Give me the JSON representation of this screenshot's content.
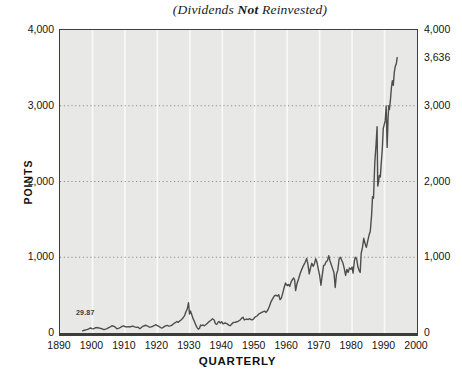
{
  "title": {
    "prefix": "(Dividends ",
    "emphasis": "Not",
    "suffix": " Reinvested)"
  },
  "colors": {
    "plot_bg": "#e8e8e6",
    "grid_vertical": "#f8f8f6",
    "grid_dotted": "#8e8e8e",
    "line": "#4e4e4e",
    "frame": "#3d3d3d",
    "text": "#111111"
  },
  "chart_data": {
    "type": "line",
    "title": "(Dividends Not Reinvested)",
    "xlabel": "QUARTERLY",
    "ylabel": "POINTS",
    "xlim": [
      1890,
      2000
    ],
    "ylim": [
      0,
      4000
    ],
    "grid": {
      "horizontal_dotted_at": [
        1000,
        2000,
        3000
      ],
      "vertical_lines_at": [
        1900,
        1910,
        1920,
        1930,
        1940,
        1950,
        1960,
        1970,
        1980,
        1990
      ]
    },
    "y_ticks_left": [
      {
        "label": "4,000",
        "value": 4000
      },
      {
        "label": "3,000",
        "value": 3000
      },
      {
        "label": "2,000",
        "value": 2000
      },
      {
        "label": "1,000",
        "value": 1000
      },
      {
        "label": "0",
        "value": 0
      }
    ],
    "y_ticks_right": [
      {
        "label": "4,000",
        "value": 4000
      },
      {
        "label": "3,636",
        "value": 3636
      },
      {
        "label": "3,000",
        "value": 3000
      },
      {
        "label": "2,000",
        "value": 2000
      },
      {
        "label": "1,000",
        "value": 1000
      },
      {
        "label": "0",
        "value": 0
      }
    ],
    "x_ticks": [
      {
        "label": "1890",
        "value": 1890
      },
      {
        "label": "1900",
        "value": 1900
      },
      {
        "label": "1910",
        "value": 1910
      },
      {
        "label": "1920",
        "value": 1920
      },
      {
        "label": "1930",
        "value": 1930
      },
      {
        "label": "1940",
        "value": 1940
      },
      {
        "label": "1950",
        "value": 1950
      },
      {
        "label": "1960",
        "value": 1960
      },
      {
        "label": "1970",
        "value": 1970
      },
      {
        "label": "1980",
        "value": 1980
      },
      {
        "label": "1990",
        "value": 1990
      },
      {
        "label": "2000",
        "value": 2000
      }
    ],
    "start_value_label": "29.87",
    "end_value_label": "3,636",
    "series": [
      {
        "name": "Dow Jones Industrial Average (points, quarterly)",
        "points": [
          [
            1897.0,
            30
          ],
          [
            1897.5,
            36
          ],
          [
            1898.0,
            42
          ],
          [
            1898.5,
            47
          ],
          [
            1899.0,
            58
          ],
          [
            1899.4,
            66
          ],
          [
            1899.8,
            58
          ],
          [
            1900.2,
            54
          ],
          [
            1900.6,
            60
          ],
          [
            1901.0,
            70
          ],
          [
            1901.5,
            72
          ],
          [
            1902.0,
            66
          ],
          [
            1902.5,
            62
          ],
          [
            1903.0,
            54
          ],
          [
            1903.5,
            45
          ],
          [
            1904.0,
            50
          ],
          [
            1904.5,
            58
          ],
          [
            1905.0,
            72
          ],
          [
            1905.5,
            80
          ],
          [
            1906.0,
            96
          ],
          [
            1906.5,
            90
          ],
          [
            1907.0,
            78
          ],
          [
            1907.5,
            56
          ],
          [
            1908.0,
            62
          ],
          [
            1908.5,
            72
          ],
          [
            1909.0,
            84
          ],
          [
            1909.5,
            94
          ],
          [
            1910.0,
            86
          ],
          [
            1910.5,
            80
          ],
          [
            1911.0,
            84
          ],
          [
            1911.5,
            80
          ],
          [
            1912.0,
            86
          ],
          [
            1912.5,
            90
          ],
          [
            1913.0,
            80
          ],
          [
            1913.5,
            75
          ],
          [
            1914.0,
            78
          ],
          [
            1914.6,
            56
          ],
          [
            1915.0,
            70
          ],
          [
            1915.5,
            88
          ],
          [
            1916.0,
            96
          ],
          [
            1916.5,
            102
          ],
          [
            1917.0,
            92
          ],
          [
            1917.6,
            76
          ],
          [
            1918.0,
            80
          ],
          [
            1918.5,
            86
          ],
          [
            1919.0,
            96
          ],
          [
            1919.5,
            110
          ],
          [
            1920.0,
            96
          ],
          [
            1920.5,
            86
          ],
          [
            1921.0,
            72
          ],
          [
            1921.5,
            66
          ],
          [
            1922.0,
            80
          ],
          [
            1922.5,
            94
          ],
          [
            1923.0,
            100
          ],
          [
            1923.5,
            90
          ],
          [
            1924.0,
            94
          ],
          [
            1924.5,
            104
          ],
          [
            1925.0,
            122
          ],
          [
            1925.5,
            136
          ],
          [
            1926.0,
            152
          ],
          [
            1926.4,
            140
          ],
          [
            1926.8,
            156
          ],
          [
            1927.2,
            168
          ],
          [
            1927.6,
            185
          ],
          [
            1928.0,
            205
          ],
          [
            1928.4,
            230
          ],
          [
            1928.8,
            280
          ],
          [
            1929.2,
            315
          ],
          [
            1929.6,
            400
          ],
          [
            1929.9,
            250
          ],
          [
            1930.2,
            290
          ],
          [
            1930.6,
            240
          ],
          [
            1931.0,
            190
          ],
          [
            1931.4,
            155
          ],
          [
            1931.8,
            110
          ],
          [
            1932.2,
            75
          ],
          [
            1932.6,
            50
          ],
          [
            1933.0,
            62
          ],
          [
            1933.3,
            105
          ],
          [
            1933.7,
            98
          ],
          [
            1934.0,
            106
          ],
          [
            1934.5,
            95
          ],
          [
            1935.0,
            112
          ],
          [
            1935.5,
            132
          ],
          [
            1936.0,
            152
          ],
          [
            1936.5,
            168
          ],
          [
            1937.0,
            188
          ],
          [
            1937.5,
            172
          ],
          [
            1937.9,
            122
          ],
          [
            1938.3,
            112
          ],
          [
            1938.7,
            142
          ],
          [
            1939.0,
            152
          ],
          [
            1939.4,
            132
          ],
          [
            1939.8,
            150
          ],
          [
            1940.2,
            122
          ],
          [
            1940.6,
            128
          ],
          [
            1941.0,
            132
          ],
          [
            1941.5,
            120
          ],
          [
            1942.0,
            104
          ],
          [
            1942.4,
            96
          ],
          [
            1942.8,
            112
          ],
          [
            1943.2,
            132
          ],
          [
            1943.6,
            140
          ],
          [
            1944.0,
            142
          ],
          [
            1944.5,
            148
          ],
          [
            1945.0,
            158
          ],
          [
            1945.5,
            172
          ],
          [
            1946.0,
            196
          ],
          [
            1946.4,
            208
          ],
          [
            1946.8,
            172
          ],
          [
            1947.2,
            180
          ],
          [
            1947.6,
            184
          ],
          [
            1948.0,
            178
          ],
          [
            1948.4,
            190
          ],
          [
            1948.8,
            178
          ],
          [
            1949.2,
            174
          ],
          [
            1949.6,
            182
          ],
          [
            1950.0,
            206
          ],
          [
            1950.4,
            218
          ],
          [
            1950.8,
            228
          ],
          [
            1951.2,
            250
          ],
          [
            1951.6,
            258
          ],
          [
            1952.0,
            268
          ],
          [
            1952.5,
            280
          ],
          [
            1953.0,
            288
          ],
          [
            1953.5,
            272
          ],
          [
            1954.0,
            300
          ],
          [
            1954.5,
            350
          ],
          [
            1955.0,
            410
          ],
          [
            1955.5,
            450
          ],
          [
            1956.0,
            486
          ],
          [
            1956.5,
            500
          ],
          [
            1957.0,
            488
          ],
          [
            1957.4,
            505
          ],
          [
            1957.8,
            440
          ],
          [
            1958.2,
            460
          ],
          [
            1958.6,
            520
          ],
          [
            1959.0,
            590
          ],
          [
            1959.5,
            660
          ],
          [
            1960.0,
            625
          ],
          [
            1960.4,
            640
          ],
          [
            1960.8,
            615
          ],
          [
            1961.2,
            672
          ],
          [
            1961.6,
            705
          ],
          [
            1962.0,
            726
          ],
          [
            1962.3,
            700
          ],
          [
            1962.6,
            560
          ],
          [
            1963.0,
            650
          ],
          [
            1963.5,
            712
          ],
          [
            1964.0,
            785
          ],
          [
            1964.5,
            840
          ],
          [
            1965.0,
            890
          ],
          [
            1965.5,
            930
          ],
          [
            1966.0,
            985
          ],
          [
            1966.4,
            905
          ],
          [
            1966.8,
            780
          ],
          [
            1967.2,
            860
          ],
          [
            1967.6,
            920
          ],
          [
            1968.0,
            880
          ],
          [
            1968.4,
            915
          ],
          [
            1968.8,
            980
          ],
          [
            1969.2,
            930
          ],
          [
            1969.6,
            840
          ],
          [
            1970.0,
            760
          ],
          [
            1970.4,
            630
          ],
          [
            1970.8,
            760
          ],
          [
            1971.2,
            890
          ],
          [
            1971.6,
            900
          ],
          [
            1972.0,
            940
          ],
          [
            1972.4,
            955
          ],
          [
            1972.8,
            1020
          ],
          [
            1973.2,
            950
          ],
          [
            1973.6,
            900
          ],
          [
            1974.0,
            850
          ],
          [
            1974.4,
            800
          ],
          [
            1974.8,
            600
          ],
          [
            1975.2,
            780
          ],
          [
            1975.6,
            830
          ],
          [
            1976.0,
            975
          ],
          [
            1976.4,
            1000
          ],
          [
            1976.8,
            960
          ],
          [
            1977.2,
            920
          ],
          [
            1977.6,
            850
          ],
          [
            1978.0,
            760
          ],
          [
            1978.4,
            840
          ],
          [
            1978.8,
            800
          ],
          [
            1979.2,
            860
          ],
          [
            1979.6,
            840
          ],
          [
            1980.0,
            870
          ],
          [
            1980.3,
            790
          ],
          [
            1980.7,
            950
          ],
          [
            1981.0,
            1000
          ],
          [
            1981.4,
            980
          ],
          [
            1981.8,
            870
          ],
          [
            1982.2,
            820
          ],
          [
            1982.5,
            800
          ],
          [
            1982.8,
            1050
          ],
          [
            1983.2,
            1130
          ],
          [
            1983.6,
            1250
          ],
          [
            1984.0,
            1180
          ],
          [
            1984.4,
            1130
          ],
          [
            1984.8,
            1210
          ],
          [
            1985.2,
            1290
          ],
          [
            1985.6,
            1340
          ],
          [
            1986.0,
            1550
          ],
          [
            1986.3,
            1800
          ],
          [
            1986.6,
            1780
          ],
          [
            1987.0,
            2250
          ],
          [
            1987.4,
            2500
          ],
          [
            1987.7,
            2722
          ],
          [
            1987.9,
            1940
          ],
          [
            1988.1,
            1980
          ],
          [
            1988.4,
            2080
          ],
          [
            1988.7,
            2060
          ],
          [
            1989.0,
            2250
          ],
          [
            1989.3,
            2420
          ],
          [
            1989.6,
            2700
          ],
          [
            1989.9,
            2750
          ],
          [
            1990.2,
            2800
          ],
          [
            1990.5,
            2999
          ],
          [
            1990.8,
            2450
          ],
          [
            1991.1,
            2850
          ],
          [
            1991.3,
            3000
          ],
          [
            1991.5,
            2950
          ],
          [
            1991.8,
            3070
          ],
          [
            1992.1,
            3230
          ],
          [
            1992.4,
            3330
          ],
          [
            1992.7,
            3270
          ],
          [
            1993.0,
            3440
          ],
          [
            1993.3,
            3520
          ],
          [
            1993.6,
            3550
          ],
          [
            1993.9,
            3636
          ]
        ]
      }
    ]
  }
}
